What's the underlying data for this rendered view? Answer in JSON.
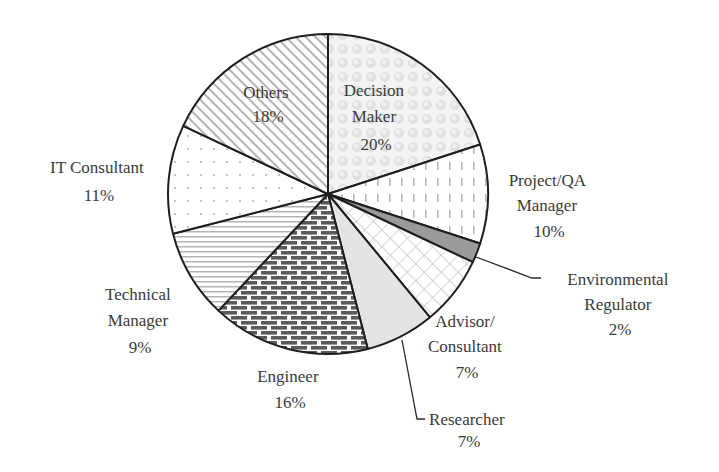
{
  "chart_data": {
    "type": "pie",
    "title": "",
    "start_angle_deg": 0,
    "direction": "clockwise",
    "slices": [
      {
        "label": "Decision Maker",
        "value": 20,
        "pattern": "bubbles",
        "label_lines": [
          "Decision",
          "Maker",
          "20%"
        ]
      },
      {
        "label": "Project/QA Manager",
        "value": 10,
        "pattern": "vertical-dashes",
        "label_lines": [
          "Project/QA",
          "Manager",
          "10%"
        ]
      },
      {
        "label": "Environmental Regulator",
        "value": 2,
        "pattern": "solid-gray",
        "label_lines": [
          "Environmental",
          "Regulator",
          "2%"
        ]
      },
      {
        "label": "Advisor/Consultant",
        "value": 7,
        "pattern": "diamond-crosshatch",
        "label_lines": [
          "Advisor/",
          "Consultant",
          "7%"
        ]
      },
      {
        "label": "Researcher",
        "value": 7,
        "pattern": "light-gray",
        "label_lines": [
          "Researcher",
          "7%"
        ]
      },
      {
        "label": "Engineer",
        "value": 16,
        "pattern": "brick",
        "label_lines": [
          "Engineer",
          "16%"
        ]
      },
      {
        "label": "Technical Manager",
        "value": 9,
        "pattern": "horizontal-lines",
        "label_lines": [
          "Technical",
          "Manager",
          "9%"
        ]
      },
      {
        "label": "IT Consultant",
        "value": 11,
        "pattern": "dots",
        "label_lines": [
          "IT Consultant",
          "11%"
        ]
      },
      {
        "label": "Others",
        "value": 18,
        "pattern": "diagonal-hatch",
        "label_lines": [
          "Others",
          "18%"
        ]
      }
    ],
    "unit": "%"
  },
  "colors": {
    "outline": "#1e1e1e",
    "text": "#3a3a3a",
    "pattern_gray": "#b4b4b4",
    "brick_dark": "#5a5a5a",
    "env_fill": "#9a9a9a",
    "researcher_fill": "#e4e4e4"
  }
}
